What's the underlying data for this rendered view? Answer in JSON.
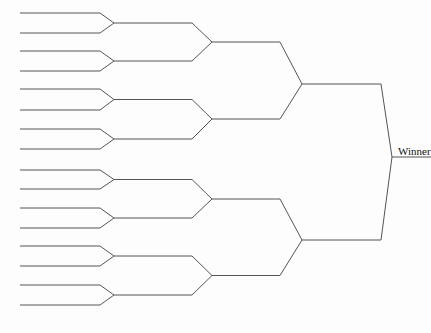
{
  "canvas": {
    "width": 431,
    "height": 333,
    "background_color": "#fdfdfd",
    "line_color": "#555555",
    "text_color": "#111111",
    "line_width": 1
  },
  "diagram": {
    "type": "single-elimination-tournament-bracket",
    "title": "",
    "orientation": "left-to-right",
    "connector_style": "chevron",
    "entrant_count": 16,
    "round_count": 5
  },
  "labels": {
    "winner": "Winner",
    "winner_truncated": true,
    "winner_x": 398,
    "winner_y": 155
  },
  "rounds": [
    {
      "index": 0,
      "name": "Round of 16",
      "slot_count": 16,
      "line_start_x": 20,
      "line_end_x": 100,
      "apex_x": 114,
      "slot_y": [
        13,
        33,
        51,
        71,
        89,
        110,
        129,
        149,
        170,
        189,
        208,
        228,
        246,
        266,
        285,
        305
      ]
    },
    {
      "index": 1,
      "name": "Round of 8",
      "slot_count": 8,
      "line_start_x": 114,
      "line_end_x": 192,
      "apex_x": 212,
      "slot_y": [
        23,
        61,
        99.5,
        139,
        179.5,
        218,
        256,
        295
      ]
    },
    {
      "index": 2,
      "name": "Quarterfinals",
      "slot_count": 4,
      "line_start_x": 212,
      "line_end_x": 280,
      "apex_x": 302,
      "slot_y": [
        42,
        119,
        199,
        275.5
      ]
    },
    {
      "index": 3,
      "name": "Semifinals",
      "slot_count": 2,
      "line_start_x": 302,
      "line_end_x": 381,
      "apex_x": 392,
      "slot_y": [
        84,
        240
      ]
    },
    {
      "index": 4,
      "name": "Final",
      "slot_count": 1,
      "line_start_x": 392,
      "line_end_x": 431,
      "apex_x": 431,
      "slot_y": [
        157
      ]
    }
  ]
}
